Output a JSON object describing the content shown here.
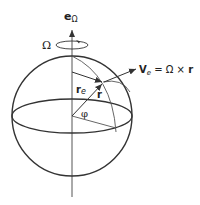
{
  "diagram": {
    "type": "rotating-sphere-vector-diagram",
    "labels": {
      "axis_unit_vector": "e",
      "axis_unit_vector_sub": "Ω",
      "angular_velocity": "Ω",
      "position_vector": "r",
      "radial_component": "r",
      "radial_component_sub": "e",
      "angle": "φ",
      "velocity_lhs": "V",
      "velocity_lhs_sub": "e",
      "velocity_rhs": " = Ω × ",
      "velocity_rhs_vec": "r"
    },
    "colors": {
      "stroke": "#333333",
      "background": "#ffffff"
    }
  }
}
